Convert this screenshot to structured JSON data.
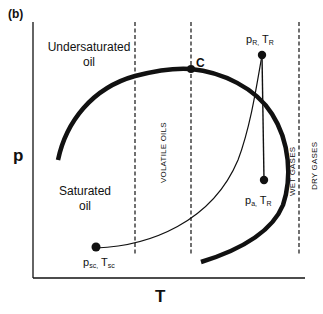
{
  "panel_label": "(b)",
  "axes": {
    "x_label": "T",
    "y_label": "p"
  },
  "regions": {
    "undersaturated_line1": "Undersaturated",
    "undersaturated_line2": "oil",
    "saturated_line1": "Saturated",
    "saturated_line2": "oil",
    "volatile_oils": "VOLATILE OILS",
    "wet_gases": "WET GASES",
    "dry_gases": "DRY GASES"
  },
  "points": {
    "critical": {
      "label": "C"
    },
    "reservoir": {
      "p": "p",
      "p_sub": "R,",
      "t": "T",
      "t_sub": "R"
    },
    "abandonment": {
      "p": "p",
      "p_sub": "a,",
      "t": "T",
      "t_sub": "R"
    },
    "standard": {
      "p": "p",
      "p_sub": "sc,",
      "t": "T",
      "t_sub": "sc"
    }
  },
  "colors": {
    "ink": "#111111",
    "background": "#ffffff"
  }
}
